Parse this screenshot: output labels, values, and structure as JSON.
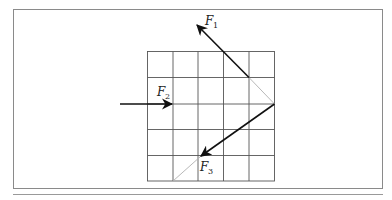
{
  "diagram": {
    "type": "force-vectors-on-grid",
    "grid": {
      "columns": 5,
      "rows": 5
    },
    "vectors": [
      {
        "id": "F1",
        "label": "F",
        "subscript": "1",
        "direction": "up-left"
      },
      {
        "id": "F2",
        "label": "F",
        "subscript": "2",
        "direction": "right"
      },
      {
        "id": "F3",
        "label": "F",
        "subscript": "3",
        "direction": "down-left"
      }
    ]
  },
  "colors": {
    "frame": "#888888",
    "grid": "#555555",
    "vector": "#111111",
    "guide": "#aaaaaa"
  }
}
